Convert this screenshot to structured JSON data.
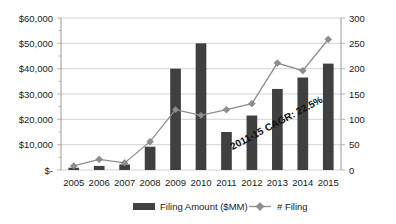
{
  "chart_data": {
    "type": "bar",
    "title": "",
    "xlabel": "",
    "categories": [
      "2005",
      "2006",
      "2007",
      "2008",
      "2009",
      "2010",
      "2011",
      "2012",
      "2013",
      "2014",
      "2015"
    ],
    "series": [
      {
        "name": "Filing Amount ($MM)",
        "type": "bar",
        "axis": "left",
        "color": "#404040",
        "values": [
          900,
          1600,
          2200,
          9200,
          40000,
          50000,
          15000,
          21500,
          32000,
          36500,
          42000
        ]
      },
      {
        "name": "# Filing",
        "type": "line",
        "axis": "right",
        "color": "#8e8e8e",
        "values": [
          8,
          21,
          14,
          56,
          119,
          108,
          119,
          131,
          211,
          196,
          258
        ]
      }
    ],
    "left_axis": {
      "label": "",
      "ylim": [
        0,
        60000
      ],
      "tick_values": [
        0,
        10000,
        20000,
        30000,
        40000,
        50000,
        60000
      ],
      "tick_labels": [
        "$-",
        "$10,000",
        "$20,000",
        "$30,000",
        "$40,000",
        "$50,000",
        "$60,000"
      ]
    },
    "right_axis": {
      "label": "",
      "ylim": [
        0,
        300
      ],
      "tick_values": [
        0,
        50,
        100,
        150,
        200,
        250,
        300
      ],
      "tick_labels": [
        "0",
        "50",
        "100",
        "150",
        "200",
        "250",
        "300"
      ]
    },
    "grid": true,
    "legend": {
      "position": "bottom",
      "entries": [
        {
          "label": "Filing Amount ($MM)",
          "marker": "bar",
          "color": "#404040"
        },
        {
          "label": "# Filing",
          "marker": "line-diamond",
          "color": "#8e8e8e"
        }
      ]
    },
    "annotations": [
      {
        "text": "2011-15 CAGR: 22.5%",
        "rotation": -28,
        "x": 278,
        "y": 126
      }
    ]
  }
}
